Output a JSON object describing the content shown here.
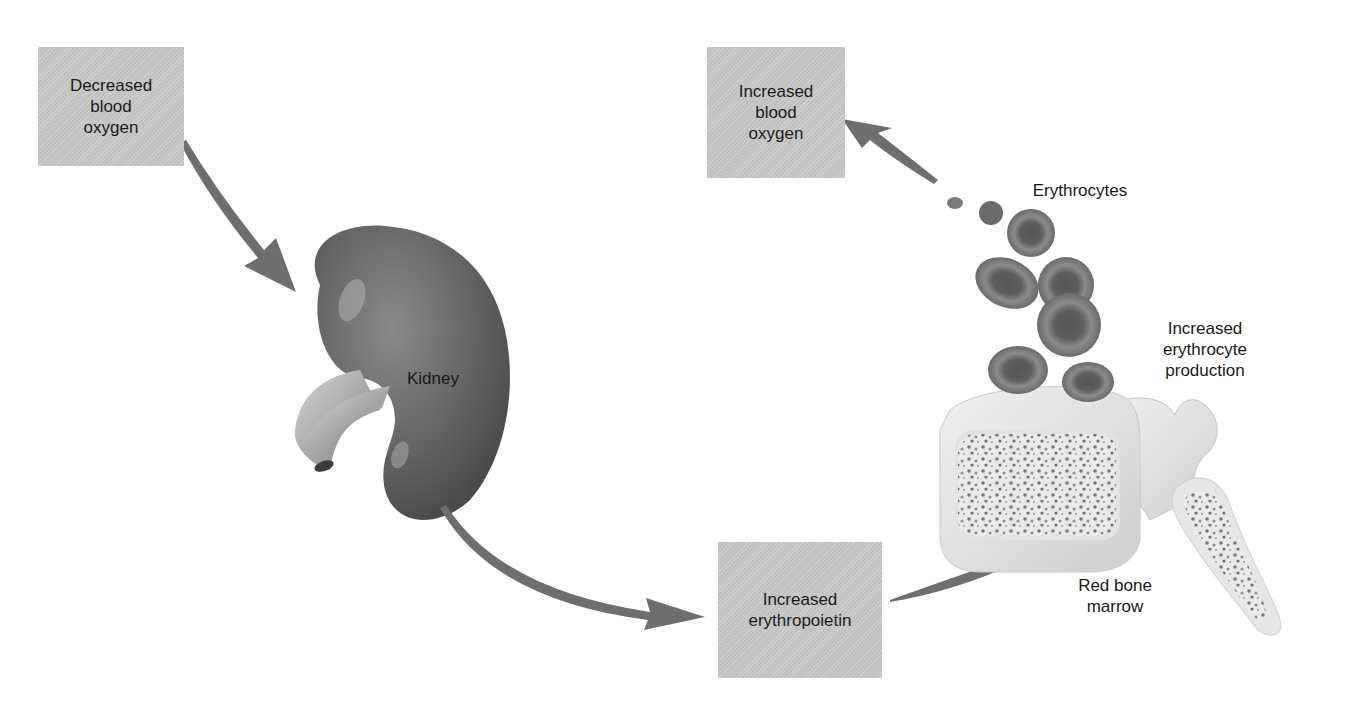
{
  "diagram": {
    "topic": "Erythropoietin feedback regulation of erythrocyte production",
    "boxes": [
      {
        "id": "decreased-blood-oxygen",
        "text": "Decreased\nblood\noxygen"
      },
      {
        "id": "increased-blood-oxygen",
        "text": "Increased\nblood\noxygen"
      },
      {
        "id": "increased-erythropoietin",
        "text": "Increased\nerythropoietin"
      }
    ],
    "labels": {
      "kidney": "Kidney",
      "erythrocytes": "Erythrocytes",
      "increased_erythrocyte_production": "Increased\nerythrocyte\nproduction",
      "red_bone_marrow": "Red bone\nmarrow"
    },
    "flow": [
      {
        "from": "Decreased blood oxygen",
        "to": "Kidney"
      },
      {
        "from": "Kidney",
        "to": "Increased erythropoietin"
      },
      {
        "from": "Increased erythropoietin",
        "to": "Red bone marrow"
      },
      {
        "from": "Red bone marrow",
        "to": "Erythrocytes"
      },
      {
        "from": "Erythrocytes",
        "to": "Increased blood oxygen"
      }
    ],
    "colors": {
      "box_fill": "#c9c9c9",
      "arrow": "#6e6e6e",
      "kidney": "#6a6a6a",
      "rbc": "#6d6d6d",
      "bone": "#e4e4e4",
      "text": "#1a1a1a"
    }
  }
}
